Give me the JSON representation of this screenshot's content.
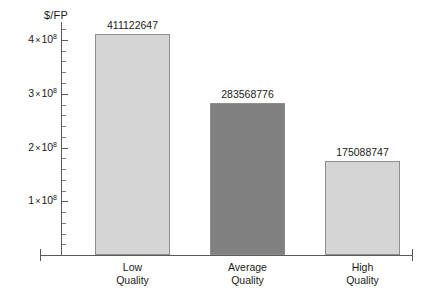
{
  "chart_data": {
    "type": "bar",
    "title": "",
    "subtitle": "",
    "xlabel": "",
    "ylabel": "$/FP",
    "categories": [
      "Low Quality",
      "Average Quality",
      "High Quality"
    ],
    "category_lines": [
      {
        "line1": "Low",
        "line2": "Quality"
      },
      {
        "line1": "Average",
        "line2": "Quality"
      },
      {
        "line1": "High",
        "line2": "Quality"
      }
    ],
    "values": [
      411122647,
      283568776,
      175088747
    ],
    "value_labels": [
      "411122647",
      "283568776",
      "175088747"
    ],
    "bar_colors": [
      "#d5d5d5",
      "#808080",
      "#d5d5d5"
    ],
    "bar_border_color": "#8e8e8e",
    "ylim": [
      0,
      440000000
    ],
    "grid": false,
    "legend": false,
    "axis_color": "#5a5a5a",
    "y_ticks": [
      {
        "value": 100000000,
        "mantissa": "1",
        "exponent": "8"
      },
      {
        "value": 200000000,
        "mantissa": "2",
        "exponent": "8"
      },
      {
        "value": 300000000,
        "mantissa": "3",
        "exponent": "8"
      },
      {
        "value": 400000000,
        "mantissa": "4",
        "exponent": "8"
      }
    ],
    "y_minor_tick_step": 20000000,
    "times_symbol": "×"
  }
}
